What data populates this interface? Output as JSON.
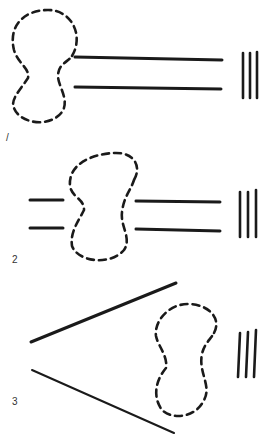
{
  "figure": {
    "panels": [
      {
        "id": 1,
        "label": "/"
      },
      {
        "id": 2,
        "label": "2"
      },
      {
        "id": 3,
        "label": "3"
      }
    ]
  },
  "colors": {
    "ink": "#1a1a1a",
    "label": "#333333",
    "background": "#ffffff"
  }
}
